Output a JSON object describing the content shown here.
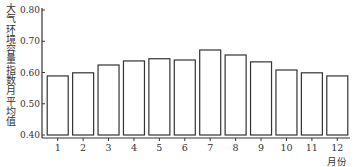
{
  "chart_data": {
    "type": "bar",
    "title": "",
    "xlabel": "月份",
    "ylabel": "大气环境容量指数月平均值",
    "categories": [
      "1",
      "2",
      "3",
      "4",
      "5",
      "6",
      "7",
      "8",
      "9",
      "10",
      "11",
      "12"
    ],
    "values": [
      0.589,
      0.599,
      0.624,
      0.637,
      0.644,
      0.64,
      0.672,
      0.656,
      0.634,
      0.608,
      0.599,
      0.589
    ],
    "ylim": [
      0.4,
      0.8
    ],
    "yticks": [
      "0.40",
      "0.50",
      "0.60",
      "0.70",
      "0.80"
    ],
    "grid": false,
    "legend": null,
    "style": {
      "bar_fill": "#ffffff",
      "bar_stroke": "#333333"
    }
  }
}
